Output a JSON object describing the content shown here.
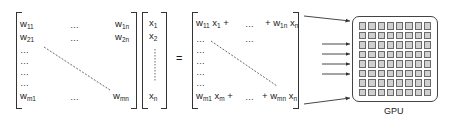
{
  "diagram": {
    "matrix_w": {
      "rows": [
        {
          "first": {
            "base": "w",
            "sub": "11"
          },
          "middle": "…",
          "last": {
            "base": "w",
            "sub": "1n"
          }
        },
        {
          "first": {
            "base": "w",
            "sub": "21"
          },
          "middle": "…",
          "last": {
            "base": "w",
            "sub": "2n"
          }
        },
        {
          "first": "…"
        },
        {
          "first": "…"
        },
        {
          "first": "…"
        },
        {
          "first": "…"
        },
        {
          "first": {
            "base": "w",
            "sub": "m1"
          },
          "middle": "…",
          "last": {
            "base": "w",
            "sub": "mn"
          }
        }
      ]
    },
    "vector_x": {
      "entries": [
        {
          "base": "x",
          "sub": "1"
        },
        {
          "base": "x",
          "sub": "2"
        },
        {
          "base": "x",
          "sub": "n"
        }
      ]
    },
    "equals_sign": "=",
    "result": {
      "top_row": {
        "left": "w11 x1 +",
        "left_base1": "w",
        "left_sub1": "11",
        "left_base2": "x",
        "left_sub2": "1",
        "left_op": "+",
        "middle": "…",
        "right_op": "+",
        "right_base1": "w",
        "right_sub1": "1n",
        "right_base2": "x",
        "right_sub2": "n"
      },
      "second_row": {
        "left": "…",
        "middle": "…"
      },
      "filler_rows": [
        "…",
        "…",
        "…",
        "…"
      ],
      "bottom_row": {
        "left_base1": "w",
        "left_sub1": "m1",
        "left_base2": "x",
        "left_sub2": "m",
        "left_op": "+",
        "middle": "…",
        "right_op": "+",
        "right_base1": "w",
        "right_sub1": "mn",
        "right_base2": "x",
        "right_sub2": "n"
      }
    },
    "arrows": {
      "count": 6,
      "color": "#333333"
    },
    "gpu": {
      "label": "GPU",
      "grid_rows": 8,
      "grid_cols": 8,
      "cell_fill": "#d0d0d0",
      "cell_border": "#6a6a6a"
    }
  }
}
